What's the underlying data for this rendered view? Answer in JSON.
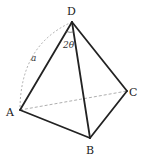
{
  "diagram": {
    "type": "tetrahedron",
    "vertices": [
      {
        "name": "D",
        "x": 72,
        "y": 22,
        "label_x": 68,
        "label_y": 16
      },
      {
        "name": "A",
        "x": 20,
        "y": 110,
        "label_x": 7,
        "label_y": 116
      },
      {
        "name": "B",
        "x": 90,
        "y": 138,
        "label_x": 86,
        "label_y": 154
      },
      {
        "name": "C",
        "x": 127,
        "y": 91,
        "label_x": 130,
        "label_y": 96
      }
    ],
    "solid_edges": [
      "DA",
      "DB",
      "DC",
      "AB",
      "BC"
    ],
    "hidden_edges": [
      "AC"
    ],
    "labels": {
      "D": "D",
      "A": "A",
      "B": "B",
      "C": "C",
      "angle_ADB": "2θ",
      "length_DA": "a"
    },
    "colors": {
      "edge": "#222222",
      "hidden": "#999999",
      "background": "#ffffff"
    }
  }
}
